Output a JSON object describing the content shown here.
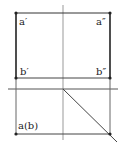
{
  "diagram": {
    "type": "orthographic-projection",
    "colors": {
      "line": "#2a2a2a",
      "axis": "#888888",
      "point": "#222222",
      "background": "#ffffff"
    },
    "labels": {
      "a_front": "a′",
      "a_side": "a″",
      "b_front": "b′",
      "b_side": "b″",
      "a_top": "a(b)"
    },
    "points": [
      {
        "id": "a_front",
        "x": 16,
        "y": 13
      },
      {
        "id": "a_side",
        "x": 110,
        "y": 13
      },
      {
        "id": "b_front",
        "x": 16,
        "y": 78
      },
      {
        "id": "b_side",
        "x": 110,
        "y": 78
      },
      {
        "id": "a_top",
        "x": 16,
        "y": 134
      },
      {
        "id": "corner",
        "x": 110,
        "y": 134
      }
    ]
  }
}
